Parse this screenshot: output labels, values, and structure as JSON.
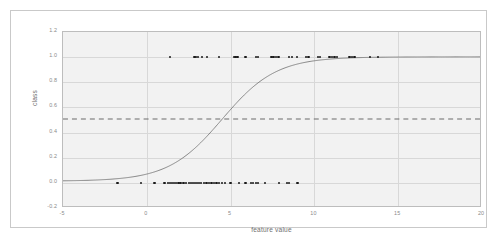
{
  "chart_data": {
    "type": "scatter",
    "title": "",
    "subtitle": "",
    "xlabel": "feature value",
    "ylabel": "class",
    "xlim": [
      -5,
      20
    ],
    "ylim": [
      -0.2,
      1.2
    ],
    "xticks": [
      "-5",
      "0",
      "5",
      "10",
      "15",
      "20"
    ],
    "xtick_values": [
      -5,
      0,
      5,
      10,
      15,
      20
    ],
    "yticks": [
      "-0.2",
      "0.0",
      "0.2",
      "0.4",
      "0.6",
      "0.8",
      "1.0",
      "1.2"
    ],
    "ytick_values": [
      -0.2,
      0.0,
      0.2,
      0.4,
      0.6,
      0.8,
      1.0,
      1.2
    ],
    "grid": true,
    "legend": null,
    "legend_position": "none",
    "series": [
      {
        "name": "observations",
        "type": "scatter",
        "marker": "circle",
        "color": "#1a1a1a",
        "points": [
          {
            "x": -1.75,
            "y": 0.0
          },
          {
            "x": -0.35,
            "y": 0.0
          },
          {
            "x": 0.45,
            "y": 0.0
          },
          {
            "x": 1.05,
            "y": 0.0
          },
          {
            "x": 1.25,
            "y": 0.0
          },
          {
            "x": 1.4,
            "y": 0.0
          },
          {
            "x": 1.5,
            "y": 0.0
          },
          {
            "x": 1.62,
            "y": 0.0
          },
          {
            "x": 1.75,
            "y": 0.0
          },
          {
            "x": 1.88,
            "y": 0.0
          },
          {
            "x": 2.0,
            "y": 0.0
          },
          {
            "x": 2.2,
            "y": 0.0
          },
          {
            "x": 2.35,
            "y": 0.0
          },
          {
            "x": 2.5,
            "y": 0.0
          },
          {
            "x": 2.62,
            "y": 0.0
          },
          {
            "x": 2.75,
            "y": 0.0
          },
          {
            "x": 2.88,
            "y": 0.0
          },
          {
            "x": 3.0,
            "y": 0.0
          },
          {
            "x": 3.12,
            "y": 0.0
          },
          {
            "x": 3.25,
            "y": 0.0
          },
          {
            "x": 3.4,
            "y": 0.0
          },
          {
            "x": 3.55,
            "y": 0.0
          },
          {
            "x": 3.7,
            "y": 0.0
          },
          {
            "x": 3.85,
            "y": 0.0
          },
          {
            "x": 4.0,
            "y": 0.0
          },
          {
            "x": 4.15,
            "y": 0.0
          },
          {
            "x": 4.3,
            "y": 0.0
          },
          {
            "x": 4.5,
            "y": 0.0
          },
          {
            "x": 4.65,
            "y": 0.0
          },
          {
            "x": 5.0,
            "y": 0.0
          },
          {
            "x": 5.5,
            "y": 0.0
          },
          {
            "x": 5.9,
            "y": 0.0
          },
          {
            "x": 6.2,
            "y": 0.0
          },
          {
            "x": 6.35,
            "y": 0.0
          },
          {
            "x": 6.5,
            "y": 0.0
          },
          {
            "x": 6.65,
            "y": 0.0
          },
          {
            "x": 7.05,
            "y": 0.0
          },
          {
            "x": 7.9,
            "y": 0.0
          },
          {
            "x": 8.35,
            "y": 0.0
          },
          {
            "x": 8.5,
            "y": 0.0
          },
          {
            "x": 9.0,
            "y": 0.0
          },
          {
            "x": 1.4,
            "y": 1.0
          },
          {
            "x": 2.85,
            "y": 1.0
          },
          {
            "x": 2.95,
            "y": 1.0
          },
          {
            "x": 3.05,
            "y": 1.0
          },
          {
            "x": 3.3,
            "y": 1.0
          },
          {
            "x": 3.6,
            "y": 1.0
          },
          {
            "x": 4.3,
            "y": 1.0
          },
          {
            "x": 5.2,
            "y": 1.0
          },
          {
            "x": 5.3,
            "y": 1.0
          },
          {
            "x": 5.4,
            "y": 1.0
          },
          {
            "x": 5.9,
            "y": 1.0
          },
          {
            "x": 6.5,
            "y": 1.0
          },
          {
            "x": 6.65,
            "y": 1.0
          },
          {
            "x": 7.45,
            "y": 1.0
          },
          {
            "x": 7.55,
            "y": 1.0
          },
          {
            "x": 7.7,
            "y": 1.0
          },
          {
            "x": 7.85,
            "y": 1.0
          },
          {
            "x": 8.5,
            "y": 1.0
          },
          {
            "x": 8.65,
            "y": 1.0
          },
          {
            "x": 8.95,
            "y": 1.0
          },
          {
            "x": 9.5,
            "y": 1.0
          },
          {
            "x": 9.65,
            "y": 1.0
          },
          {
            "x": 10.2,
            "y": 1.0
          },
          {
            "x": 10.35,
            "y": 1.0
          },
          {
            "x": 10.9,
            "y": 1.0
          },
          {
            "x": 11.05,
            "y": 1.0
          },
          {
            "x": 11.2,
            "y": 1.0
          },
          {
            "x": 11.35,
            "y": 1.0
          },
          {
            "x": 12.1,
            "y": 1.0
          },
          {
            "x": 12.25,
            "y": 1.0
          },
          {
            "x": 12.4,
            "y": 1.0
          },
          {
            "x": 13.3,
            "y": 1.0
          },
          {
            "x": 13.8,
            "y": 1.0
          }
        ]
      },
      {
        "name": "logistic fit",
        "type": "line",
        "color": "#7a7a7a",
        "midpoint": 4.55,
        "steepness": 0.62
      }
    ],
    "annotations": [
      {
        "name": "decision-threshold",
        "type": "hline",
        "value": 0.5,
        "style": "dashed",
        "color": "#6a6a6a"
      }
    ]
  }
}
